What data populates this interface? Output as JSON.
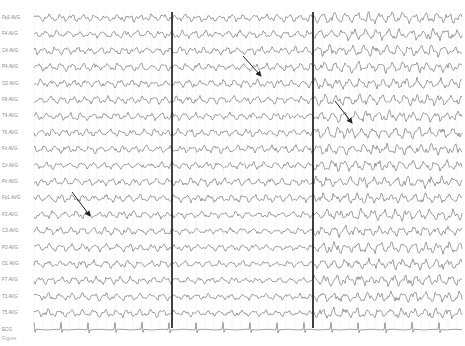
{
  "figure": {
    "caption": "Figure",
    "channels": [
      "Fp2 AVG",
      "F4 AVG",
      "C4 AVG",
      "P4 AVG",
      "O2 AVG",
      "F8 AVG",
      "T4 AVG",
      "T6 AVG",
      "Fz AVG",
      "Cz AVG",
      "Pz AVG",
      "Fp1 AVG",
      "F3 AVG",
      "C3 AVG",
      "P3 AVG",
      "O1 AVG",
      "F7 AVG",
      "T3 AVG",
      "T5 AVG",
      "ECG"
    ],
    "layout": {
      "top": 18,
      "spacing": 16.4,
      "trace_left": 34,
      "trace_right": 462
    },
    "markers": [
      {
        "x": 172
      },
      {
        "x": 313
      }
    ],
    "arrows": [
      {
        "x1": 243,
        "y1": 56,
        "x2": 261,
        "y2": 76
      },
      {
        "x1": 335,
        "y1": 101,
        "x2": 352,
        "y2": 123
      },
      {
        "x1": 72,
        "y1": 192,
        "x2": 90,
        "y2": 216
      }
    ],
    "ecg_interval_px": 27,
    "colors": {
      "trace": "#555555",
      "grid": "#e2e2e2",
      "marker": "#111111",
      "arrow": "#222222"
    }
  }
}
